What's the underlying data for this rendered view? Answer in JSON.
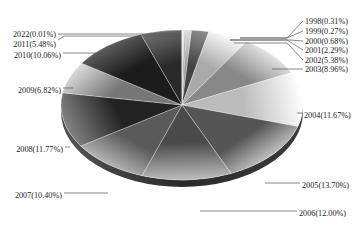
{
  "chart_data": {
    "type": "pie",
    "title": "",
    "style": "3d-pie-grayscale",
    "start_angle": "12 o'clock, clockwise",
    "categories": [
      "1998",
      "1999",
      "2000",
      "2001",
      "2002",
      "2003",
      "2004",
      "2005",
      "2006",
      "2007",
      "2008",
      "2009",
      "2010",
      "2011",
      "2022"
    ],
    "values": [
      0.31,
      0.27,
      0.68,
      2.29,
      5.38,
      8.96,
      11.67,
      13.7,
      12.0,
      10.4,
      11.77,
      6.82,
      10.06,
      5.48,
      0.01
    ],
    "unit": "%",
    "labels": [
      "1998(0.31%)",
      "1999(0.27%)",
      "2000(0.68%)",
      "2001(2.29%)",
      "2002(5.38%)",
      "2003(8.96%)",
      "2004(11.67%)",
      "2005(13.70%)",
      "2006(12.00%)",
      "2007(10.40%)",
      "2008(11.77%)",
      "2009(6.82%)",
      "2010(10.06%)",
      "2011(5.48%)",
      "2022(0.01%)"
    ],
    "legend": "none (leader-line labels)"
  }
}
